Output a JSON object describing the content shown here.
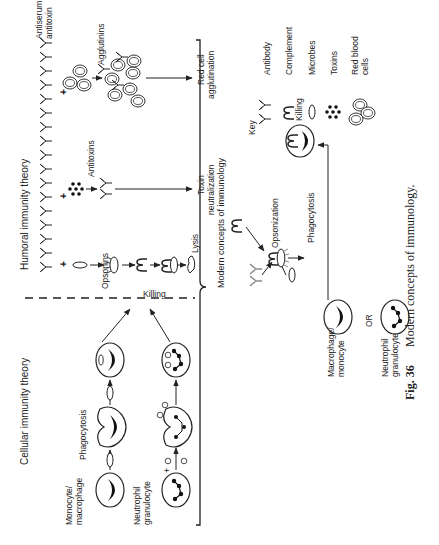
{
  "figure": {
    "rotation_deg": -90,
    "caption_number": "Fig. 36",
    "caption_text": "Modern concepts of immunology.",
    "sections": {
      "cellular": {
        "title": "Cellular immunity theory",
        "cell1_label_a": "Monocyte/",
        "cell1_label_b": "macrophage",
        "cell2_label_a": "Neutrophil",
        "cell2_label_b": "granulocyte",
        "phagocytosis": "Phagocytosis",
        "killing": "Killing",
        "plus": "+"
      },
      "humoral": {
        "title": "Humoral immunity theory",
        "antiserum_a": "Antiserum or",
        "antiserum_b": "antitoxin",
        "opsonins": "Opsonins",
        "lysis": "Lysis",
        "antitoxins": "Antitoxins",
        "toxin_neut_a": "Toxin",
        "toxin_neut_b": "neutralization",
        "agglutinins": "Agglutinins",
        "rbc_agg_a": "Red cell",
        "rbc_agg_b": "agglutination",
        "plus": "+"
      },
      "modern": {
        "title": "Modern concepts of immunology",
        "opsonization": "Opsonization",
        "phagocytosis": "Phagocytosis",
        "killing": "Killing",
        "cell1_label_a": "Macrophage/",
        "cell1_label_b": "monocyte",
        "or": "OR",
        "cell2_label_a": "Neutrophil",
        "cell2_label_b": "granulocyte"
      },
      "key": {
        "title": "Key",
        "items": [
          {
            "icon": "antibody-icon",
            "label": "Antibody"
          },
          {
            "icon": "complement-icon",
            "label": "Complement"
          },
          {
            "icon": "microbe-icon",
            "label": "Microbes"
          },
          {
            "icon": "toxin-icon",
            "label": "Toxins"
          },
          {
            "icon": "red-blood-cell-icon",
            "label_a": "Red blood",
            "label_b": "cells"
          }
        ]
      }
    }
  }
}
